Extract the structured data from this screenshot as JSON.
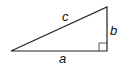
{
  "diagram": {
    "type": "right-triangle",
    "labels": {
      "hypotenuse": "c",
      "vertical_leg": "b",
      "horizontal_leg": "a"
    },
    "right_angle_marker": true,
    "stroke_color": "#222222"
  }
}
